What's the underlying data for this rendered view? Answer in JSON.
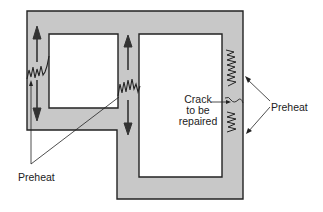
{
  "diagram": {
    "type": "preheat-locations-for-crack-repair",
    "labels": {
      "crack": [
        "Crack",
        "to be",
        "repaired"
      ],
      "preheat_left": "Preheat",
      "preheat_right": "Preheat"
    },
    "colors": {
      "frame_fill": "#c8c8c8",
      "outline": "#222222",
      "background": "#ffffff"
    }
  }
}
